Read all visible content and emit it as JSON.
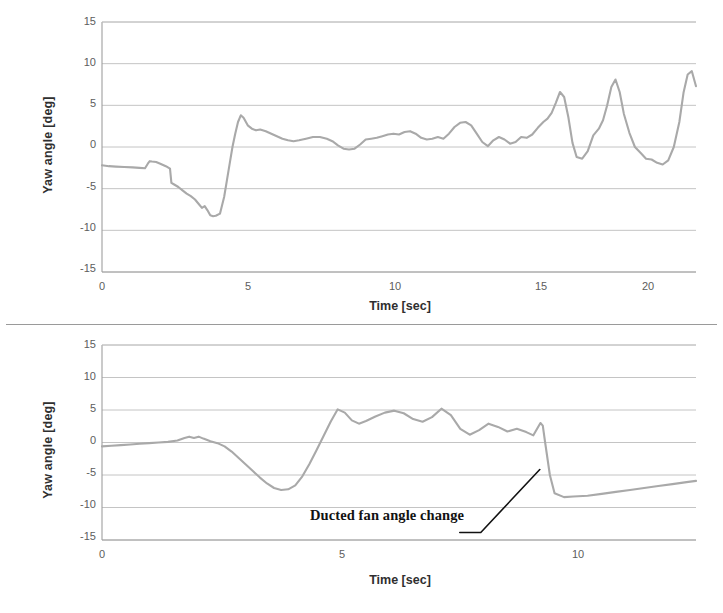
{
  "figure": {
    "title": "",
    "panel_count": 2
  },
  "chart_data": [
    {
      "id": "top",
      "type": "line",
      "title": "",
      "xlabel": "Time [sec]",
      "ylabel": "Yaw angle [deg]",
      "xlim": [
        0,
        21.4
      ],
      "ylim": [
        -15,
        15
      ],
      "xticks": [
        0,
        5,
        10,
        15,
        20
      ],
      "xtick_labels": [
        "0",
        "5",
        "10",
        "15",
        "20"
      ],
      "yticks": [
        15,
        10,
        5,
        0,
        -5,
        -10,
        -15
      ],
      "ytick_labels": [
        "15",
        "10",
        "5",
        "0",
        "-5",
        "-10",
        "-15"
      ],
      "grid": true,
      "grid_axis": "y",
      "legend": false,
      "line_color": "#a9a9a9",
      "series": [
        {
          "name": "Yaw angle",
          "x": [
            0.0,
            0.25,
            0.5,
            0.8,
            1.1,
            1.35,
            1.55,
            1.65,
            1.72,
            1.8,
            1.95,
            2.1,
            2.3,
            2.45,
            2.5,
            2.6,
            2.75,
            2.9,
            3.05,
            3.2,
            3.35,
            3.5,
            3.6,
            3.7,
            3.8,
            3.9,
            4.0,
            4.1,
            4.25,
            4.4,
            4.5,
            4.6,
            4.7,
            4.8,
            4.9,
            5.0,
            5.1,
            5.25,
            5.4,
            5.55,
            5.7,
            5.9,
            6.1,
            6.3,
            6.5,
            6.7,
            6.9,
            7.1,
            7.35,
            7.6,
            7.85,
            8.1,
            8.3,
            8.5,
            8.7,
            8.9,
            9.1,
            9.3,
            9.5,
            9.7,
            9.9,
            10.1,
            10.3,
            10.5,
            10.7,
            10.9,
            11.1,
            11.3,
            11.5,
            11.7,
            11.9,
            12.1,
            12.3,
            12.5,
            12.7,
            12.9,
            13.1,
            13.3,
            13.5,
            13.7,
            13.9,
            14.1,
            14.3,
            14.5,
            14.7,
            14.9,
            15.1,
            15.3,
            15.5,
            15.7,
            15.9,
            16.05,
            16.2,
            16.35,
            16.5,
            16.65,
            16.8,
            16.95,
            17.1,
            17.3,
            17.5,
            17.7,
            17.9,
            18.05,
            18.2,
            18.35,
            18.5,
            18.65,
            18.8,
            19.0,
            19.2,
            19.4,
            19.6,
            19.8,
            20.0,
            20.2,
            20.4,
            20.6,
            20.8,
            20.95,
            21.1,
            21.25,
            21.4
          ],
          "y": [
            -2.2,
            -2.3,
            -2.35,
            -2.4,
            -2.45,
            -2.5,
            -2.55,
            -2.0,
            -1.7,
            -1.75,
            -1.8,
            -2.0,
            -2.3,
            -2.6,
            -4.3,
            -4.5,
            -4.8,
            -5.2,
            -5.6,
            -5.9,
            -6.3,
            -6.9,
            -7.3,
            -7.1,
            -7.6,
            -8.2,
            -8.3,
            -8.25,
            -8.0,
            -6.0,
            -4.0,
            -2.0,
            0.0,
            1.6,
            3.0,
            3.8,
            3.5,
            2.6,
            2.2,
            2.0,
            2.1,
            1.9,
            1.6,
            1.3,
            1.0,
            0.8,
            0.7,
            0.8,
            1.0,
            1.2,
            1.2,
            1.0,
            0.7,
            0.2,
            -0.2,
            -0.3,
            -0.2,
            0.3,
            0.9,
            1.0,
            1.1,
            1.3,
            1.5,
            1.6,
            1.5,
            1.8,
            1.9,
            1.6,
            1.1,
            0.9,
            1.0,
            1.2,
            1.0,
            1.6,
            2.4,
            2.9,
            3.0,
            2.6,
            1.6,
            0.6,
            0.1,
            0.8,
            1.2,
            0.9,
            0.4,
            0.6,
            1.2,
            1.1,
            1.5,
            2.3,
            3.0,
            3.4,
            4.1,
            5.3,
            6.6,
            6.0,
            3.6,
            0.5,
            -1.2,
            -1.4,
            -0.5,
            1.4,
            2.2,
            3.2,
            5.0,
            7.2,
            8.1,
            6.6,
            4.0,
            1.7,
            0.0,
            -0.7,
            -1.4,
            -1.5,
            -1.9,
            -2.1,
            -1.6,
            0.0,
            3.0,
            6.5,
            8.7,
            9.1,
            7.3,
            4.5
          ]
        }
      ]
    },
    {
      "id": "bottom",
      "type": "line",
      "title": "",
      "xlabel": "Time [sec]",
      "ylabel": "Yaw angle [deg]",
      "xlim": [
        0,
        12.6
      ],
      "ylim": [
        -15,
        15
      ],
      "xticks": [
        0,
        5,
        10
      ],
      "xtick_labels": [
        "0",
        "5",
        "10"
      ],
      "yticks": [
        15,
        10,
        5,
        0,
        -5,
        -10,
        -15
      ],
      "ytick_labels": [
        "15",
        "10",
        "5",
        "0",
        "-5",
        "-10",
        "-15"
      ],
      "grid": true,
      "grid_axis": "y",
      "legend": false,
      "line_color": "#a9a9a9",
      "annotations": [
        {
          "name": "ducted-fan-angle-change",
          "text": "Ducted fan angle change",
          "target_x": 9.35,
          "target_y": -4.0
        }
      ],
      "series": [
        {
          "name": "Yaw angle",
          "x": [
            0.0,
            0.2,
            0.4,
            0.6,
            0.8,
            1.0,
            1.2,
            1.4,
            1.6,
            1.75,
            1.85,
            1.95,
            2.05,
            2.15,
            2.3,
            2.45,
            2.6,
            2.75,
            2.9,
            3.05,
            3.2,
            3.35,
            3.5,
            3.65,
            3.8,
            3.95,
            4.1,
            4.25,
            4.4,
            4.55,
            4.7,
            4.85,
            5.0,
            5.15,
            5.3,
            5.45,
            5.6,
            5.8,
            6.0,
            6.2,
            6.4,
            6.6,
            6.8,
            7.0,
            7.2,
            7.4,
            7.6,
            7.8,
            8.0,
            8.2,
            8.4,
            8.6,
            8.8,
            9.0,
            9.15,
            9.3,
            9.35,
            9.4,
            9.5,
            9.6,
            9.8,
            10.0,
            10.3,
            10.6,
            10.9,
            11.2,
            11.5,
            11.8,
            12.1,
            12.4,
            12.6
          ],
          "y": [
            -0.6,
            -0.5,
            -0.4,
            -0.3,
            -0.2,
            -0.1,
            0.0,
            0.1,
            0.3,
            0.7,
            0.9,
            0.7,
            0.9,
            0.6,
            0.2,
            -0.1,
            -0.6,
            -1.4,
            -2.4,
            -3.4,
            -4.4,
            -5.4,
            -6.3,
            -7.0,
            -7.3,
            -7.2,
            -6.6,
            -5.2,
            -3.3,
            -1.2,
            1.0,
            3.2,
            5.1,
            4.6,
            3.4,
            2.9,
            3.3,
            4.0,
            4.6,
            4.9,
            4.5,
            3.6,
            3.2,
            3.9,
            5.2,
            4.2,
            2.1,
            1.2,
            1.9,
            2.9,
            2.4,
            1.7,
            2.1,
            1.6,
            1.1,
            3.0,
            2.6,
            0.0,
            -5.0,
            -7.8,
            -8.4,
            -8.3,
            -8.2,
            -7.9,
            -7.6,
            -7.3,
            -7.0,
            -6.7,
            -6.4,
            -6.1,
            -5.9
          ]
        }
      ]
    }
  ]
}
